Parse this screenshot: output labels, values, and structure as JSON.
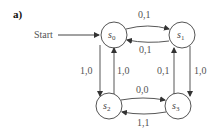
{
  "diagram": {
    "panel_label": "a)",
    "start_label": "Start",
    "states": [
      {
        "id": "s0",
        "name": "s",
        "sub": "0"
      },
      {
        "id": "s1",
        "name": "s",
        "sub": "1"
      },
      {
        "id": "s2",
        "name": "s",
        "sub": "2"
      },
      {
        "id": "s3",
        "name": "s",
        "sub": "3"
      }
    ],
    "transitions": [
      {
        "from": "s0",
        "to": "s1",
        "label": "0,1"
      },
      {
        "from": "s1",
        "to": "s0",
        "label": "0,1"
      },
      {
        "from": "s0",
        "to": "s2",
        "label": "1,0"
      },
      {
        "from": "s2",
        "to": "s0",
        "label": "1,0"
      },
      {
        "from": "s3",
        "to": "s1",
        "label": "0,1"
      },
      {
        "from": "s1",
        "to": "s3",
        "label": "1,0"
      },
      {
        "from": "s2",
        "to": "s3",
        "label": "0,0"
      },
      {
        "from": "s3",
        "to": "s2",
        "label": "1,1"
      }
    ],
    "colors": {
      "stroke": "#444444",
      "text": "#555555"
    }
  }
}
